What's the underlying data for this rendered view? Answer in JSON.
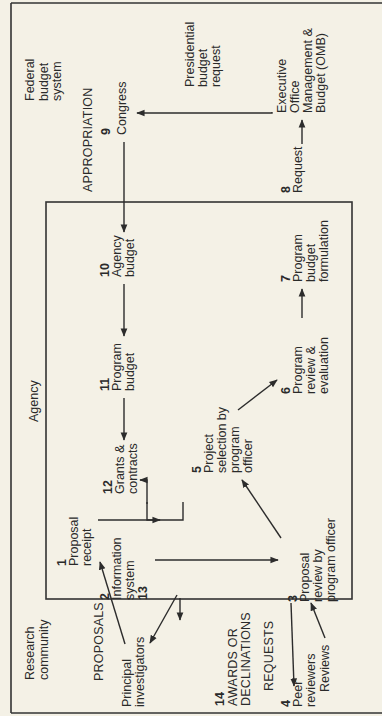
{
  "diagram": {
    "title_region_federal": [
      "Federal",
      "budget",
      "system"
    ],
    "title_region_agency": "Agency",
    "title_region_research": [
      "Research",
      "community"
    ],
    "flow_labels": {
      "appropriation": "APPROPRIATION",
      "proposals": "PROPOSALS",
      "awards": [
        "AWARDS OR",
        "DECLINATIONS"
      ],
      "requests": "REQUESTS",
      "presidential_request": [
        "Presidential",
        "budget",
        "request"
      ],
      "reviews": "Reviews"
    },
    "nodes": [
      {
        "id": 1,
        "num": "1",
        "lines": [
          "Proposal",
          "receipt"
        ]
      },
      {
        "id": 2,
        "num": "2",
        "lines": [
          "Information",
          "system"
        ],
        "extra_num": "13"
      },
      {
        "id": 3,
        "num": "3",
        "lines": [
          "Proposal",
          "review by",
          "program officer"
        ]
      },
      {
        "id": 4,
        "num": "4",
        "lines": [
          "Peer",
          "reviewers"
        ]
      },
      {
        "id": 5,
        "num": "5",
        "lines": [
          "Project",
          "selection by",
          "program",
          "officer"
        ]
      },
      {
        "id": 6,
        "num": "6",
        "lines": [
          "Program",
          "review &",
          "evaluation"
        ]
      },
      {
        "id": 7,
        "num": "7",
        "lines": [
          "Program",
          "budget",
          "formulation"
        ]
      },
      {
        "id": 8,
        "num": "8",
        "lines": [
          "Request"
        ]
      },
      {
        "id": 9,
        "num": "9",
        "lines": [
          "Congress"
        ]
      },
      {
        "id": 10,
        "num": "10",
        "lines": [
          "Agency",
          "budget"
        ]
      },
      {
        "id": 11,
        "num": "11",
        "lines": [
          "Program",
          "budget"
        ]
      },
      {
        "id": 12,
        "num": "12",
        "lines": [
          "Grants &",
          "contracts"
        ]
      },
      {
        "id": 14,
        "num": "14",
        "lines": []
      }
    ],
    "omb": [
      "Executive",
      "Office",
      "Management &",
      "Budget (OMB)"
    ],
    "principal_investigators": [
      "Principal",
      "investigators"
    ],
    "colors": {
      "background": "#f4f1e6",
      "ink": "#2a2a2a"
    }
  }
}
